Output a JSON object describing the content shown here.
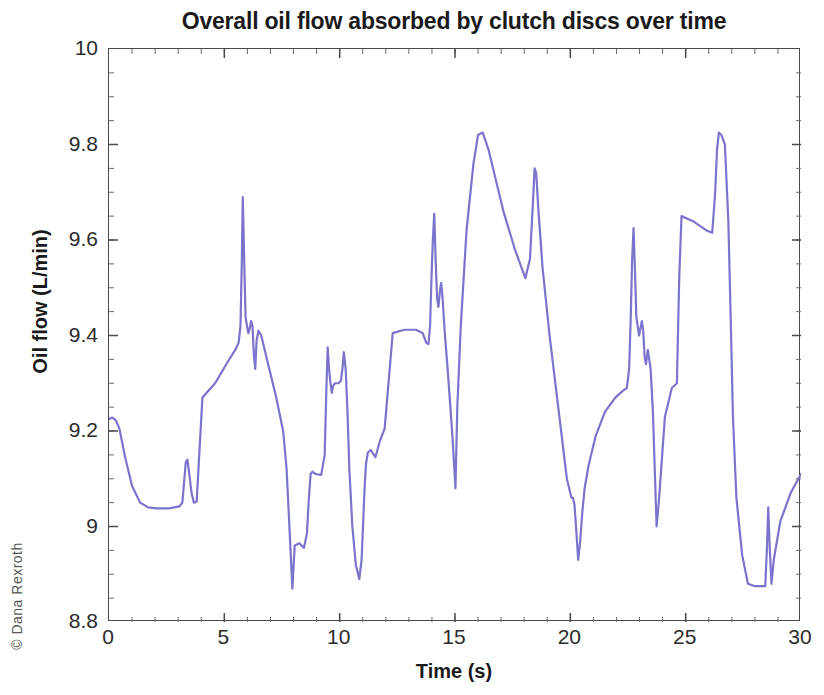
{
  "figure": {
    "watermark": "© Dana Rexroth"
  },
  "chart_data": {
    "type": "line",
    "title": "Overall oil flow absorbed by clutch discs over time",
    "xlabel": "Time (s)",
    "ylabel": "Oil flow (L/min)",
    "xlim": [
      0,
      30
    ],
    "ylim": [
      8.8,
      10
    ],
    "xticks": [
      0,
      5,
      10,
      15,
      20,
      25,
      30
    ],
    "xtick_labels": [
      "0",
      "5",
      "10",
      "15",
      "20",
      "25",
      "30"
    ],
    "yticks": [
      8.8,
      9.0,
      9.2,
      9.4,
      9.6,
      9.8,
      10.0
    ],
    "ytick_labels": [
      "8.8",
      "9",
      "9.2",
      "9.4",
      "9.6",
      "9.8",
      "10"
    ],
    "grid": false,
    "minor_ticks": true,
    "legend": null,
    "line_color": "#7B73CC",
    "line_width": 2.2,
    "series": [
      {
        "name": "Overall oil flow",
        "x": [
          0.0,
          0.15,
          0.3,
          0.45,
          0.7,
          1.0,
          1.35,
          1.7,
          2.05,
          2.6,
          3.05,
          3.18,
          3.25,
          3.33,
          3.4,
          3.48,
          3.58,
          3.68,
          3.8,
          4.05,
          4.6,
          5.15,
          5.5,
          5.62,
          5.7,
          5.76,
          5.8,
          5.86,
          5.92,
          5.98,
          6.04,
          6.1,
          6.16,
          6.22,
          6.28,
          6.34,
          6.4,
          6.48,
          6.6,
          6.9,
          7.25,
          7.55,
          7.7,
          7.8,
          7.88,
          7.95,
          8.05,
          8.25,
          8.45,
          8.58,
          8.66,
          8.74,
          8.82,
          8.95,
          9.2,
          9.35,
          9.42,
          9.48,
          9.54,
          9.6,
          9.66,
          9.72,
          9.8,
          9.95,
          10.05,
          10.12,
          10.18,
          10.26,
          10.34,
          10.42,
          10.55,
          10.7,
          10.85,
          10.95,
          11.02,
          11.08,
          11.14,
          11.22,
          11.35,
          11.55,
          11.75,
          11.95,
          12.3,
          12.8,
          13.3,
          13.6,
          13.75,
          13.85,
          13.92,
          13.98,
          14.04,
          14.1,
          14.16,
          14.22,
          14.28,
          14.34,
          14.4,
          14.46,
          14.55,
          14.68,
          14.8,
          14.9,
          14.96,
          15.02,
          15.1,
          15.25,
          15.5,
          15.8,
          16.0,
          16.2,
          16.45,
          16.7,
          17.1,
          17.6,
          18.05,
          18.25,
          18.38,
          18.45,
          18.52,
          18.62,
          18.8,
          19.1,
          19.5,
          19.85,
          20.05,
          20.12,
          20.18,
          20.26,
          20.34,
          20.42,
          20.52,
          20.62,
          20.8,
          21.1,
          21.5,
          21.95,
          22.3,
          22.45,
          22.55,
          22.62,
          22.68,
          22.74,
          22.8,
          22.86,
          22.92,
          22.98,
          23.04,
          23.1,
          23.16,
          23.22,
          23.28,
          23.36,
          23.48,
          23.58,
          23.66,
          23.74,
          23.85,
          24.1,
          24.4,
          24.62,
          24.72,
          24.82,
          25.3,
          25.9,
          26.15,
          26.28,
          26.36,
          26.44,
          26.55,
          26.7,
          26.85,
          26.95,
          27.05,
          27.2,
          27.45,
          27.7,
          28.0,
          28.35,
          28.45,
          28.52,
          28.58,
          28.64,
          28.72,
          28.82,
          29.1,
          29.55,
          30.0
        ],
        "y": [
          9.225,
          9.228,
          9.222,
          9.205,
          9.145,
          9.085,
          9.05,
          9.04,
          9.038,
          9.038,
          9.042,
          9.05,
          9.09,
          9.135,
          9.14,
          9.11,
          9.07,
          9.05,
          9.052,
          9.27,
          9.3,
          9.345,
          9.372,
          9.385,
          9.42,
          9.56,
          9.69,
          9.56,
          9.44,
          9.42,
          9.405,
          9.415,
          9.43,
          9.42,
          9.36,
          9.33,
          9.39,
          9.41,
          9.4,
          9.34,
          9.27,
          9.2,
          9.12,
          9.02,
          8.94,
          8.87,
          8.96,
          8.965,
          8.955,
          8.985,
          9.055,
          9.11,
          9.115,
          9.11,
          9.108,
          9.15,
          9.28,
          9.375,
          9.33,
          9.3,
          9.28,
          9.295,
          9.3,
          9.3,
          9.305,
          9.33,
          9.365,
          9.33,
          9.24,
          9.12,
          9.0,
          8.92,
          8.89,
          8.93,
          9.01,
          9.08,
          9.13,
          9.155,
          9.16,
          9.145,
          9.18,
          9.205,
          9.405,
          9.412,
          9.412,
          9.405,
          9.385,
          9.382,
          9.42,
          9.52,
          9.6,
          9.655,
          9.56,
          9.48,
          9.46,
          9.49,
          9.51,
          9.48,
          9.41,
          9.33,
          9.25,
          9.18,
          9.13,
          9.08,
          9.25,
          9.42,
          9.62,
          9.76,
          9.82,
          9.825,
          9.79,
          9.74,
          9.66,
          9.58,
          9.52,
          9.56,
          9.68,
          9.75,
          9.74,
          9.66,
          9.54,
          9.4,
          9.24,
          9.1,
          9.06,
          9.06,
          9.045,
          8.99,
          8.93,
          8.965,
          9.03,
          9.08,
          9.13,
          9.19,
          9.24,
          9.27,
          9.285,
          9.29,
          9.33,
          9.44,
          9.56,
          9.625,
          9.54,
          9.44,
          9.42,
          9.4,
          9.415,
          9.43,
          9.41,
          9.355,
          9.34,
          9.37,
          9.33,
          9.24,
          9.12,
          9.0,
          9.06,
          9.23,
          9.29,
          9.3,
          9.52,
          9.65,
          9.64,
          9.62,
          9.615,
          9.7,
          9.79,
          9.825,
          9.82,
          9.8,
          9.64,
          9.44,
          9.23,
          9.06,
          8.94,
          8.88,
          8.875,
          8.875,
          8.875,
          8.95,
          9.04,
          8.96,
          8.88,
          8.93,
          9.01,
          9.07,
          9.11
        ]
      }
    ]
  }
}
